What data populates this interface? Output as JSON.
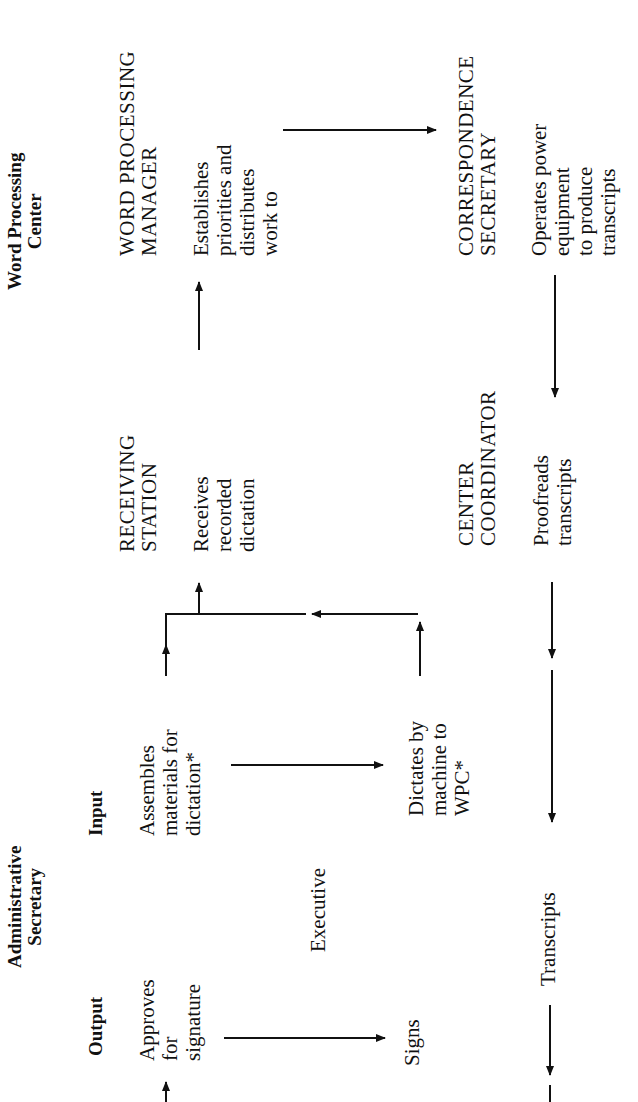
{
  "diagram": {
    "orientation": "rotated 90 degrees counter-clockwise",
    "sections": {
      "word_processing_center": {
        "title_lines": [
          "Word Processing",
          "Center"
        ]
      },
      "administrative_secretary": {
        "title_lines": [
          "Administrative",
          "Secretary"
        ]
      }
    },
    "nodes": {
      "wp_manager": {
        "title_lines": [
          "WORD PROCESSING",
          "MANAGER"
        ],
        "desc_lines": [
          "Establishes",
          "priorities and",
          "distributes",
          "work to"
        ]
      },
      "correspondence_secretary": {
        "title_lines": [
          "CORRESPONDENCE",
          "SECRETARY"
        ],
        "desc_lines": [
          "Operates power",
          "equipment",
          "to produce",
          "transcripts"
        ]
      },
      "receiving_station": {
        "title_lines": [
          "RECEIVING",
          "STATION"
        ],
        "desc_lines": [
          "Receives",
          "recorded",
          "dictation"
        ]
      },
      "center_coordinator": {
        "title_lines": [
          "CENTER",
          "COORDINATOR"
        ],
        "desc_lines": [
          "Proofreads",
          "transcripts"
        ]
      },
      "input": {
        "heading": "Input",
        "desc_lines": [
          "Assembles",
          "materials for",
          "dictation*"
        ]
      },
      "output": {
        "heading": "Output",
        "desc_lines": [
          "Approves",
          "for",
          "signature"
        ]
      },
      "executive": {
        "label": "Executive"
      },
      "dictates": {
        "desc_lines": [
          "Dictates by",
          "machine to",
          "WPC*"
        ]
      },
      "signs": {
        "label": "Signs"
      },
      "transcripts": {
        "label": "Transcripts"
      }
    },
    "colors": {
      "ink": "#111111",
      "background": "#ffffff"
    }
  }
}
